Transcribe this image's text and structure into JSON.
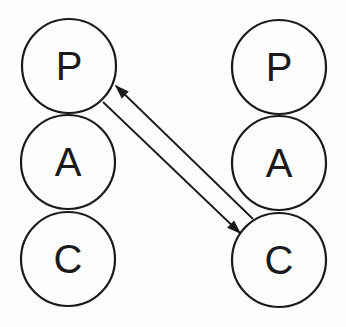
{
  "diagram": {
    "type": "transactional-analysis-ego-states",
    "left_person": {
      "states": [
        {
          "label": "P",
          "cx": 69,
          "cy": 66
        },
        {
          "label": "A",
          "cx": 68,
          "cy": 162
        },
        {
          "label": "C",
          "cx": 68,
          "cy": 259
        }
      ]
    },
    "right_person": {
      "states": [
        {
          "label": "P",
          "cx": 279,
          "cy": 67
        },
        {
          "label": "A",
          "cx": 279,
          "cy": 163
        },
        {
          "label": "C",
          "cx": 279,
          "cy": 260
        }
      ]
    },
    "radius": 47,
    "transactions": [
      {
        "from": "left.P",
        "to": "right.C",
        "direction": "to-right-C"
      },
      {
        "from": "right.C",
        "to": "left.P",
        "direction": "to-left-P"
      }
    ],
    "colors": {
      "stroke": "#1a1a1a",
      "background": "#fdfdfd"
    }
  }
}
